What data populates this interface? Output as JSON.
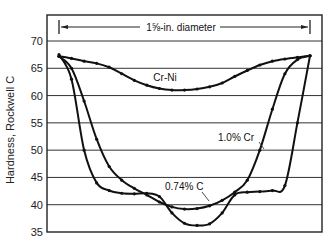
{
  "chart_data": {
    "type": "line",
    "title": "",
    "annotation": "1 5/8-in. diameter",
    "xlabel": "Position across diameter (%)",
    "ylabel": "Hardness, Rockwell C",
    "ylim": [
      35,
      72
    ],
    "yticks": [
      35,
      40,
      45,
      50,
      55,
      60,
      65,
      70
    ],
    "grid": {
      "horizontal": true,
      "vertical": false
    },
    "legend": "inline labels",
    "x": [
      0,
      5,
      10,
      15,
      20,
      25,
      30,
      35,
      40,
      45,
      50,
      55,
      60,
      65,
      70,
      75,
      80,
      85,
      90,
      95,
      100
    ],
    "series": [
      {
        "name": "Cr-Ni",
        "label_pos": {
          "x": 42,
          "y": 63.8
        },
        "values": [
          67.2,
          66.8,
          66.3,
          65.9,
          65.2,
          64.0,
          62.8,
          61.9,
          61.3,
          61.0,
          61.0,
          61.2,
          61.6,
          62.3,
          63.5,
          64.6,
          65.6,
          66.3,
          66.7,
          67.0,
          67.3
        ]
      },
      {
        "name": "1.0% Cr",
        "label_pos": {
          "x": 82,
          "y": 52.5
        },
        "values": [
          67.2,
          65.0,
          59.0,
          52.0,
          47.0,
          44.5,
          43.0,
          41.8,
          40.5,
          39.6,
          39.2,
          39.3,
          39.8,
          40.8,
          42.3,
          44.5,
          50.0,
          57.5,
          64.0,
          66.6,
          67.3
        ]
      },
      {
        "name": "0.74% C",
        "label_pos": {
          "x": 42,
          "y": 40.5
        },
        "values": [
          67.5,
          63.0,
          50.0,
          44.0,
          42.6,
          42.1,
          42.0,
          42.1,
          41.5,
          38.5,
          36.6,
          36.2,
          36.5,
          38.5,
          41.8,
          42.3,
          42.4,
          42.6,
          43.5,
          55.0,
          67.3
        ]
      }
    ]
  },
  "axis": {
    "y_tick_labels": [
      "70",
      "65",
      "60",
      "55",
      "50",
      "45",
      "40",
      "35"
    ],
    "y_label": "Hardness, Rockwell C"
  },
  "labels": {
    "diameter": "1⅝-in. diameter",
    "cr_ni": "Cr-Ni",
    "cr": "1.0% Cr",
    "c": "0.74% C"
  }
}
